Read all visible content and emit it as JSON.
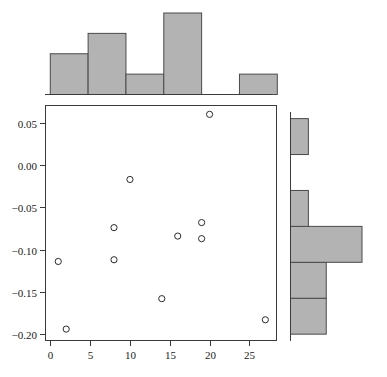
{
  "figure": {
    "type": "scatter-with-marginal-histograms",
    "background_color": "#ffffff",
    "fill_color": "#b3b3b3",
    "edge_color": "#4a4a4a",
    "marker_color": "#2b2b2b",
    "width": 387,
    "height": 377
  },
  "chart_data": {
    "type": "scatter",
    "title": "",
    "xlabel": "",
    "ylabel": "",
    "xlim": [
      -0.6,
      28.4
    ],
    "ylim": [
      -0.2075,
      0.0705
    ],
    "grid": false,
    "legend": null,
    "xticks": [
      "0",
      "5",
      "10",
      "15",
      "20",
      "25"
    ],
    "xtick_values": [
      0,
      5,
      10,
      15,
      20,
      25
    ],
    "yticks": [
      "0.05",
      "0.00",
      "-0.05",
      "-0.10",
      "-0.15",
      "-0.20"
    ],
    "ytick_values": [
      0.05,
      0.0,
      -0.05,
      -0.1,
      -0.15,
      -0.2
    ],
    "points": [
      {
        "x": 1,
        "y": -0.114
      },
      {
        "x": 2,
        "y": -0.194
      },
      {
        "x": 8,
        "y": -0.074
      },
      {
        "x": 8,
        "y": -0.112
      },
      {
        "x": 10,
        "y": -0.017
      },
      {
        "x": 14,
        "y": -0.158
      },
      {
        "x": 16,
        "y": -0.084
      },
      {
        "x": 19,
        "y": -0.068
      },
      {
        "x": 19,
        "y": -0.087
      },
      {
        "x": 20,
        "y": 0.06
      },
      {
        "x": 27,
        "y": -0.183
      }
    ],
    "marginal_x": {
      "type": "bar",
      "orientation": "vertical",
      "position": "top",
      "bin_edges": [
        0,
        4.75,
        9.5,
        14.25,
        19,
        23.75,
        28.5
      ],
      "counts": [
        2,
        3,
        1,
        4,
        0,
        1
      ],
      "categories": [
        "0-4.75",
        "4.75-9.5",
        "9.5-14.25",
        "14.25-19",
        "19-23.75",
        "23.75-28.5"
      ]
    },
    "marginal_y": {
      "type": "bar",
      "orientation": "horizontal",
      "position": "right",
      "bin_edges": [
        -0.2,
        -0.1575,
        -0.115,
        -0.0725,
        -0.03,
        0.0125,
        0.055
      ],
      "counts": [
        2,
        2,
        4,
        1,
        0,
        1
      ],
      "categories": [
        "-0.200 to -0.1575",
        "-0.1575 to -0.115",
        "-0.115 to -0.0725",
        "-0.0725 to -0.030",
        "-0.030 to 0.0125",
        "0.0125 to 0.055"
      ]
    }
  }
}
